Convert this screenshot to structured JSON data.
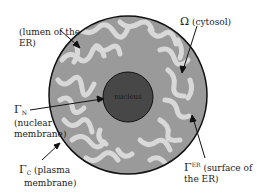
{
  "diagram": {
    "nucleus_label": "nucleus",
    "labels": {
      "lumen": {
        "line1": "(lumen of the",
        "line2": "ER)"
      },
      "cytosol": {
        "symbol": "Ω",
        "text": " (cytosol)"
      },
      "nuclear": {
        "symbol": "Γ",
        "sub": "N",
        "line2": "(nuclear",
        "line3": "membrane)"
      },
      "plasma": {
        "symbol": "Γ",
        "sub": "C",
        "text": " (plasma",
        "line2": "membrane)"
      },
      "er_surface": {
        "symbol": "Γ",
        "sup": "ER",
        "text": " (surface of",
        "line2": "the ER)"
      }
    },
    "colors": {
      "cell_fill": "#9a9a9a",
      "er_lumen": "#d8d8d8",
      "nucleus": "#474747",
      "outline": "#111111"
    }
  }
}
